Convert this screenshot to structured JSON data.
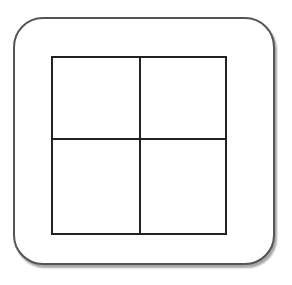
{
  "icon": {
    "name": "grid-2x2-icon",
    "rows": 2,
    "cols": 2,
    "colors": {
      "outline": "#555555",
      "grid": "#222222",
      "background": "#ffffff"
    }
  }
}
